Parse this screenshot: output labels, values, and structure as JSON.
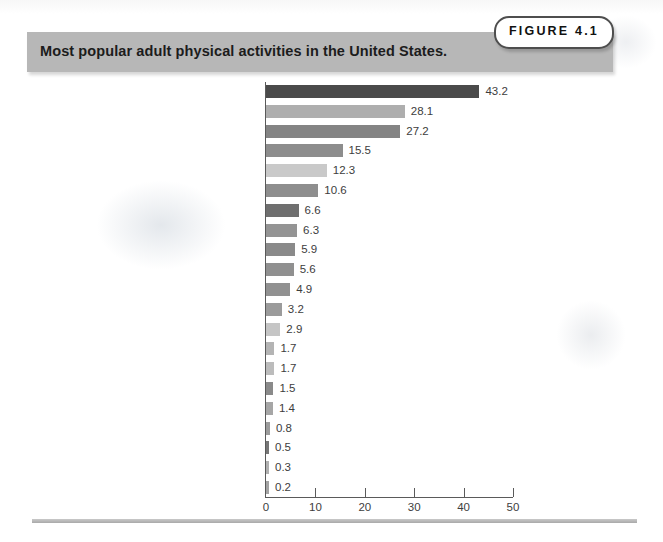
{
  "figure": {
    "badge_label": "FIGURE 4.1",
    "banner_title": "Most popular adult physical activities in the United States.",
    "banner_color": "#b7b7b7",
    "badge_border_color": "#4e4e4e"
  },
  "chart_data": {
    "type": "bar",
    "orientation": "horizontal",
    "title": "Most popular adult physical activities in the United States.",
    "xlabel": "",
    "ylabel": "",
    "xlim": [
      0,
      50
    ],
    "xticks": [
      0,
      10,
      20,
      30,
      40,
      50
    ],
    "grid": false,
    "legend": false,
    "categories": [
      "Walking for exercise",
      "Gardening/yard work",
      "Stretching exercises",
      "Strength training",
      "Bicycling or exercise bicycle",
      "Jogging",
      "Stair climbing for exercise",
      "Aerobics",
      "Basketball",
      "Swimming",
      "Golf",
      "Bowling",
      "Baseball or softball",
      "Tennis",
      "Volleyball",
      "Football",
      "Soccer",
      "Handball, racquetball, or squash",
      "Downhill skiing",
      "Water skiing",
      "Cross-country skiing"
    ],
    "values": [
      43.2,
      28.1,
      27.2,
      15.5,
      12.3,
      10.6,
      6.6,
      6.3,
      5.9,
      5.6,
      4.9,
      3.2,
      2.9,
      1.7,
      1.7,
      1.5,
      1.4,
      0.8,
      0.5,
      0.3,
      0.2
    ],
    "value_labels": [
      "43.2",
      "28.1",
      "27.2",
      "15.5",
      "12.3",
      "10.6",
      "6.6",
      "6.3",
      "5.9",
      "5.6",
      "4.9",
      "3.2",
      "2.9",
      "1.7",
      "1.7",
      "1.5",
      "1.4",
      "0.8",
      "0.5",
      "0.3",
      "0.2"
    ],
    "bar_colors": [
      "#4a4a4a",
      "#aeaeae",
      "#848484",
      "#8d8d8d",
      "#c9c9c9",
      "#8e8e8e",
      "#6f6f6f",
      "#949494",
      "#8a8a8a",
      "#909090",
      "#919191",
      "#9b9b9b",
      "#c5c5c5",
      "#b4b4b4",
      "#bcbcbc",
      "#8a8a8a",
      "#a6a6a6",
      "#9c9c9c",
      "#767676",
      "#b0b0b0",
      "#a3a3a3"
    ],
    "tick_labels": [
      "0",
      "10",
      "20",
      "30",
      "40",
      "50"
    ]
  }
}
